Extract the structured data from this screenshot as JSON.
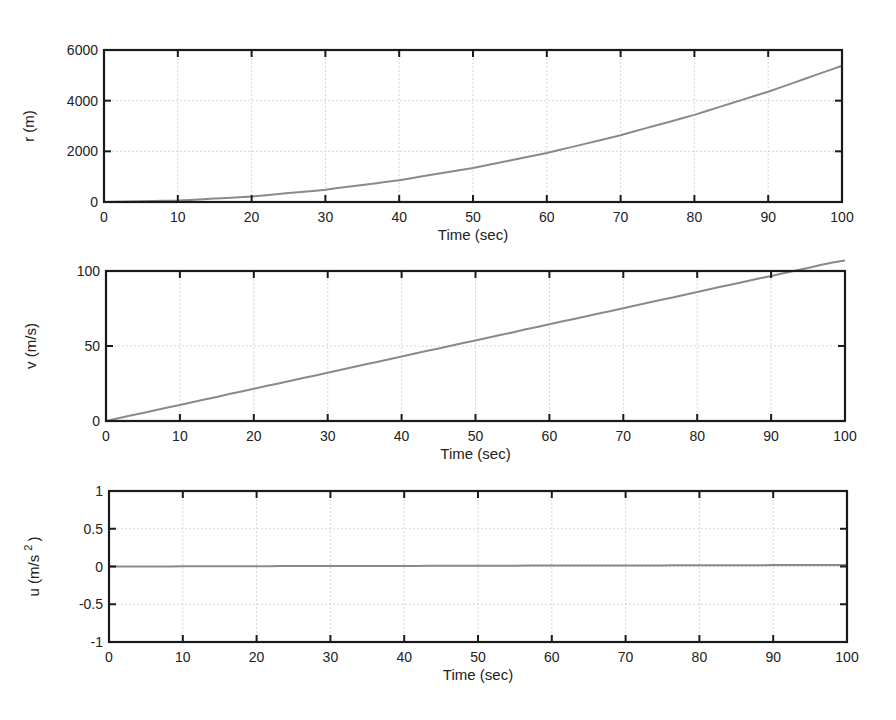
{
  "chart_data": [
    {
      "type": "line",
      "title": "",
      "xlabel": "Time (sec)",
      "ylabel": "r (m)",
      "xlim": [
        0,
        100
      ],
      "ylim": [
        0,
        6000
      ],
      "xticks": [
        0,
        10,
        20,
        30,
        40,
        50,
        60,
        70,
        80,
        90,
        100
      ],
      "yticks": [
        0,
        2000,
        4000,
        6000
      ],
      "grid": true,
      "legend": null,
      "series": [
        {
          "name": "r",
          "x": [
            0,
            10,
            20,
            30,
            40,
            50,
            60,
            70,
            80,
            90,
            100
          ],
          "values": [
            0,
            55,
            215,
            485,
            860,
            1345,
            1935,
            2635,
            3440,
            4355,
            5375
          ]
        }
      ]
    },
    {
      "type": "line",
      "title": "",
      "xlabel": "Time (sec)",
      "ylabel": "v (m/s)",
      "xlim": [
        0,
        100
      ],
      "ylim": [
        0,
        100
      ],
      "xticks": [
        0,
        10,
        20,
        30,
        40,
        50,
        60,
        70,
        80,
        90,
        100
      ],
      "yticks": [
        0,
        50,
        100
      ],
      "grid": true,
      "legend": null,
      "series": [
        {
          "name": "v",
          "x": [
            0,
            10,
            20,
            30,
            40,
            50,
            60,
            70,
            80,
            90,
            100
          ],
          "values": [
            0,
            10.7,
            21.5,
            32.2,
            43,
            53.7,
            64.5,
            75.2,
            86,
            96.7,
            107.5
          ]
        }
      ]
    },
    {
      "type": "line",
      "title": "",
      "xlabel": "Time (sec)",
      "ylabel": "u (m/s^2)",
      "xlim": [
        0,
        100
      ],
      "ylim": [
        -1,
        1
      ],
      "xticks": [
        0,
        10,
        20,
        30,
        40,
        50,
        60,
        70,
        80,
        90,
        100
      ],
      "yticks": [
        -1,
        -0.5,
        0,
        0.5,
        1
      ],
      "grid": true,
      "legend": null,
      "series": [
        {
          "name": "u",
          "x": [
            0,
            100
          ],
          "values": [
            0,
            0.02
          ]
        }
      ]
    }
  ],
  "panels": [
    {
      "name": "position-plot",
      "box": {
        "left": 104,
        "top": 50,
        "right": 842,
        "bottom": 202
      },
      "xlabel": "Time (sec)",
      "ylabel": "r (m)",
      "ylabel_sup": ""
    },
    {
      "name": "velocity-plot",
      "box": {
        "left": 106,
        "top": 271,
        "right": 845,
        "bottom": 421
      },
      "xlabel": "Time (sec)",
      "ylabel": "v (m/s)",
      "ylabel_sup": ""
    },
    {
      "name": "acceleration-plot",
      "box": {
        "left": 109,
        "top": 491,
        "right": 847,
        "bottom": 642
      },
      "xlabel": "Time (sec)",
      "ylabel": "u (m/s",
      "ylabel_sup": "2",
      "ylabel_tail": ")"
    }
  ],
  "style": {
    "line_color": "#8a8a8a",
    "axis_color": "#1a1a1a",
    "grid_color": "#d6d6d6",
    "text_color": "#222222"
  }
}
